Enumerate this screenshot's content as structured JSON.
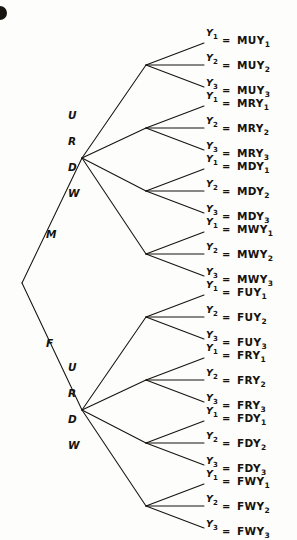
{
  "figure": {
    "type": "probability-tree-diagram",
    "corner_mark": "filled-circle-artifact",
    "background_color": "#fdfdfb",
    "ink_color": "#15130e",
    "root": {
      "x": 22,
      "y": 283
    },
    "equals_sign": "=",
    "stage_labels": {
      "level1": [
        "M",
        "F"
      ],
      "level2": [
        "U",
        "R",
        "D",
        "W"
      ],
      "level3": [
        "Y1",
        "Y2",
        "Y3"
      ]
    },
    "level1": [
      {
        "label": "M",
        "label_x": 46,
        "label_y": 229,
        "node_x": 82,
        "node_y": 158
      },
      {
        "label": "F",
        "label_x": 46,
        "label_y": 338,
        "node_x": 82,
        "node_y": 410
      }
    ],
    "level2_labels": [
      {
        "label": "U",
        "x": 68,
        "y": 110
      },
      {
        "label": "R",
        "x": 68,
        "y": 136
      },
      {
        "label": "D",
        "x": 68,
        "y": 162
      },
      {
        "label": "W",
        "x": 68,
        "y": 188
      },
      {
        "label": "U",
        "x": 68,
        "y": 362
      },
      {
        "label": "R",
        "x": 68,
        "y": 388
      },
      {
        "label": "D",
        "x": 68,
        "y": 414
      },
      {
        "label": "W",
        "x": 68,
        "y": 440
      }
    ],
    "fan_nodes": [
      {
        "x": 146,
        "y": 65
      },
      {
        "x": 146,
        "y": 128
      },
      {
        "x": 146,
        "y": 191
      },
      {
        "x": 146,
        "y": 254
      },
      {
        "x": 146,
        "y": 317
      },
      {
        "x": 146,
        "y": 380
      },
      {
        "x": 146,
        "y": 443
      },
      {
        "x": 146,
        "y": 506
      }
    ],
    "leaf_x": 206,
    "equals_x": 222,
    "outcome_x": 237,
    "leaf_tip_x": 204,
    "groups": [
      {
        "path": "MU",
        "rows": [
          {
            "y_label": "Y",
            "y_sub": "1",
            "outcome": "MUY",
            "outcome_sub": "1",
            "tip_y": 43,
            "text_y": 37
          },
          {
            "y_label": "Y",
            "y_sub": "2",
            "outcome": "MUY",
            "outcome_sub": "2",
            "tip_y": 65,
            "text_y": 62
          },
          {
            "y_label": "Y",
            "y_sub": "3",
            "outcome": "MUY",
            "outcome_sub": "3",
            "tip_y": 87,
            "text_y": 87
          }
        ]
      },
      {
        "path": "MR",
        "rows": [
          {
            "y_label": "Y",
            "y_sub": "1",
            "outcome": "MRY",
            "outcome_sub": "1",
            "tip_y": 106,
            "text_y": 100
          },
          {
            "y_label": "Y",
            "y_sub": "2",
            "outcome": "MRY",
            "outcome_sub": "2",
            "tip_y": 128,
            "text_y": 125
          },
          {
            "y_label": "Y",
            "y_sub": "3",
            "outcome": "MRY",
            "outcome_sub": "3",
            "tip_y": 150,
            "text_y": 150
          }
        ]
      },
      {
        "path": "MD",
        "rows": [
          {
            "y_label": "Y",
            "y_sub": "1",
            "outcome": "MDY",
            "outcome_sub": "1",
            "tip_y": 169,
            "text_y": 163
          },
          {
            "y_label": "Y",
            "y_sub": "2",
            "outcome": "MDY",
            "outcome_sub": "2",
            "tip_y": 191,
            "text_y": 188
          },
          {
            "y_label": "Y",
            "y_sub": "3",
            "outcome": "MDY",
            "outcome_sub": "3",
            "tip_y": 213,
            "text_y": 213
          }
        ]
      },
      {
        "path": "MW",
        "rows": [
          {
            "y_label": "Y",
            "y_sub": "1",
            "outcome": "MWY",
            "outcome_sub": "1",
            "tip_y": 232,
            "text_y": 226
          },
          {
            "y_label": "Y",
            "y_sub": "2",
            "outcome": "MWY",
            "outcome_sub": "2",
            "tip_y": 254,
            "text_y": 251
          },
          {
            "y_label": "Y",
            "y_sub": "3",
            "outcome": "MWY",
            "outcome_sub": "3",
            "tip_y": 276,
            "text_y": 276
          }
        ]
      },
      {
        "path": "FU",
        "rows": [
          {
            "y_label": "Y",
            "y_sub": "1",
            "outcome": "FUY",
            "outcome_sub": "1",
            "tip_y": 295,
            "text_y": 289
          },
          {
            "y_label": "Y",
            "y_sub": "2",
            "outcome": "FUY",
            "outcome_sub": "2",
            "tip_y": 317,
            "text_y": 314
          },
          {
            "y_label": "Y",
            "y_sub": "3",
            "outcome": "FUY",
            "outcome_sub": "3",
            "tip_y": 339,
            "text_y": 339
          }
        ]
      },
      {
        "path": "FR",
        "rows": [
          {
            "y_label": "Y",
            "y_sub": "1",
            "outcome": "FRY",
            "outcome_sub": "1",
            "tip_y": 358,
            "text_y": 352
          },
          {
            "y_label": "Y",
            "y_sub": "2",
            "outcome": "FRY",
            "outcome_sub": "2",
            "tip_y": 380,
            "text_y": 377
          },
          {
            "y_label": "Y",
            "y_sub": "3",
            "outcome": "FRY",
            "outcome_sub": "3",
            "tip_y": 402,
            "text_y": 402
          }
        ]
      },
      {
        "path": "FD",
        "rows": [
          {
            "y_label": "Y",
            "y_sub": "1",
            "outcome": "FDY",
            "outcome_sub": "1",
            "tip_y": 421,
            "text_y": 415
          },
          {
            "y_label": "Y",
            "y_sub": "2",
            "outcome": "FDY",
            "outcome_sub": "2",
            "tip_y": 443,
            "text_y": 440
          },
          {
            "y_label": "Y",
            "y_sub": "3",
            "outcome": "FDY",
            "outcome_sub": "3",
            "tip_y": 465,
            "text_y": 465
          }
        ]
      },
      {
        "path": "FW",
        "rows": [
          {
            "y_label": "Y",
            "y_sub": "1",
            "outcome": "FWY",
            "outcome_sub": "1",
            "tip_y": 484,
            "text_y": 478
          },
          {
            "y_label": "Y",
            "y_sub": "2",
            "outcome": "FWY",
            "outcome_sub": "2",
            "tip_y": 506,
            "text_y": 503
          },
          {
            "y_label": "Y",
            "y_sub": "3",
            "outcome": "FWY",
            "outcome_sub": "3",
            "tip_y": 528,
            "text_y": 528
          }
        ]
      }
    ]
  }
}
